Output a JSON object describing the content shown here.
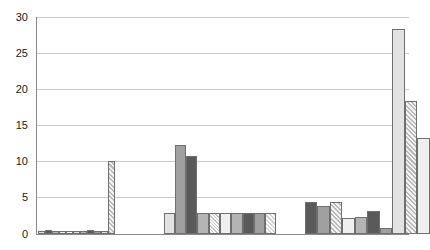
{
  "chart_data": {
    "type": "bar",
    "title": "",
    "xlabel": "",
    "ylabel": "",
    "ylim": [
      0,
      30
    ],
    "yticks": [
      0,
      5,
      10,
      15,
      20,
      25,
      30
    ],
    "ytick_labels": [
      "0",
      "5",
      "10",
      "15",
      "20",
      "25",
      "30"
    ],
    "grid": true,
    "legend": "none",
    "categories": [
      "Group 1",
      "Group 2",
      "Group 3"
    ],
    "groups": [
      {
        "name": "Group 1",
        "bars": [
          {
            "value": 0.4,
            "fill": "f-light"
          },
          {
            "value": 0.5,
            "fill": "f-darker"
          },
          {
            "value": 0.4,
            "fill": "f-mid"
          },
          {
            "value": 0.4,
            "fill": "f-lighter"
          },
          {
            "value": 0.4,
            "fill": "f-white"
          },
          {
            "value": 0.4,
            "fill": "f-light"
          },
          {
            "value": 0.4,
            "fill": "f-mid"
          },
          {
            "value": 0.5,
            "fill": "f-darker"
          },
          {
            "value": 0.4,
            "fill": "f-midgray"
          },
          {
            "value": 0.4,
            "fill": "f-light"
          },
          {
            "value": 10.1,
            "fill": "f-hatch2"
          }
        ]
      },
      {
        "name": "Group 2",
        "bars": [
          {
            "value": 2.9,
            "fill": "f-light"
          },
          {
            "value": 12.2,
            "fill": "f-midgray"
          },
          {
            "value": 10.8,
            "fill": "f-darker"
          },
          {
            "value": 2.8,
            "fill": "f-mid"
          },
          {
            "value": 2.8,
            "fill": "f-dot"
          },
          {
            "value": 2.8,
            "fill": "f-lighter"
          },
          {
            "value": 2.8,
            "fill": "f-mid"
          },
          {
            "value": 2.8,
            "fill": "f-darker"
          },
          {
            "value": 2.8,
            "fill": "f-midgray"
          },
          {
            "value": 2.8,
            "fill": "f-hatch"
          }
        ]
      },
      {
        "name": "Group 3",
        "bars": [
          {
            "value": 4.3,
            "fill": "f-darker"
          },
          {
            "value": 3.8,
            "fill": "f-midgray"
          },
          {
            "value": 4.4,
            "fill": "f-hatch2"
          },
          {
            "value": 2.2,
            "fill": "f-lighter"
          },
          {
            "value": 2.3,
            "fill": "f-mid"
          },
          {
            "value": 3.1,
            "fill": "f-darker"
          },
          {
            "value": 0.8,
            "fill": "f-midgray"
          },
          {
            "value": 28.4,
            "fill": "f-light"
          },
          {
            "value": 18.4,
            "fill": "f-hatch2"
          },
          {
            "value": 13.2,
            "fill": "f-lighter"
          }
        ]
      }
    ]
  },
  "axis": {
    "y_max_label": "30",
    "y_min_label": "0"
  }
}
